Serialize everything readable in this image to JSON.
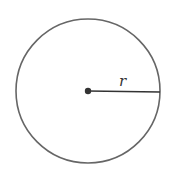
{
  "diagram": {
    "shape": "circle",
    "center": {
      "x": 88,
      "y": 91
    },
    "radius": 72,
    "radius_label": "r",
    "colors": {
      "stroke": "#666666",
      "center_dot": "#333333",
      "radius_line": "#333333",
      "background": "#ffffff"
    }
  }
}
